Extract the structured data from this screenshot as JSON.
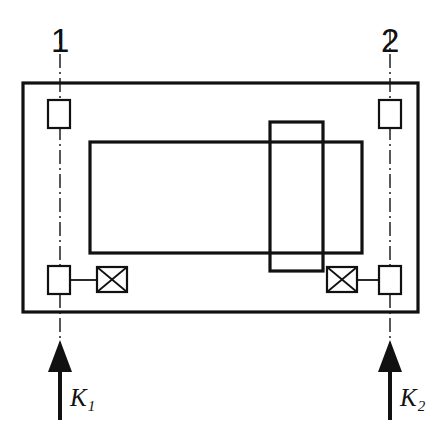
{
  "diagram": {
    "type": "engineering-line-drawing",
    "background_color": "#ffffff",
    "line_color": "#111111",
    "station_labels": [
      {
        "id": "station-1",
        "text": "1",
        "x": 60,
        "y": 24
      },
      {
        "id": "station-2",
        "text": "2",
        "x": 390,
        "y": 24
      }
    ],
    "force_labels": [
      {
        "id": "force-k1",
        "base": "K",
        "subscript": "1",
        "x": 70,
        "y": 385
      },
      {
        "id": "force-k2",
        "base": "K",
        "subscript": "2",
        "x": 400,
        "y": 385
      }
    ],
    "centerlines": [
      {
        "id": "centerline-1",
        "x": 60,
        "y_top": 30,
        "y_bottom": 348
      },
      {
        "id": "centerline-2",
        "x": 390,
        "y_top": 30,
        "y_bottom": 348
      }
    ],
    "arrows": [
      {
        "id": "arrow-k1",
        "x": 60,
        "tip_y": 340,
        "tail_y": 420,
        "head_width": 24,
        "head_height": 30
      },
      {
        "id": "arrow-k2",
        "x": 390,
        "tip_y": 340,
        "tail_y": 420,
        "head_width": 24,
        "head_height": 30
      }
    ],
    "shapes": {
      "outer_frame": {
        "id": "outer-frame",
        "x": 23,
        "y": 83,
        "width": 395,
        "height": 229,
        "stroke_width": 3.2
      },
      "main_body": {
        "id": "main-body",
        "x": 90,
        "y": 142,
        "width": 272,
        "height": 111,
        "stroke_width": 3.2
      },
      "vertical_block": {
        "id": "vertical-block",
        "x": 270,
        "y": 122,
        "width": 53,
        "height": 149,
        "stroke_width": 3.2
      },
      "pads": [
        {
          "id": "pad-top-left",
          "x": 48,
          "y": 100,
          "width": 22,
          "height": 28,
          "stroke_width": 2.2
        },
        {
          "id": "pad-top-right",
          "x": 379,
          "y": 100,
          "width": 22,
          "height": 28,
          "stroke_width": 2.2
        },
        {
          "id": "pad-bottom-left",
          "x": 48,
          "y": 266,
          "width": 22,
          "height": 28,
          "stroke_width": 2.2
        },
        {
          "id": "pad-bottom-right",
          "x": 379,
          "y": 266,
          "width": 22,
          "height": 28,
          "stroke_width": 2.2
        }
      ],
      "crossed_boxes": [
        {
          "id": "crossed-box-left",
          "x": 97,
          "y": 267,
          "width": 30,
          "height": 25,
          "stroke_width": 2.2
        },
        {
          "id": "crossed-box-right",
          "x": 327,
          "y": 267,
          "width": 30,
          "height": 25,
          "stroke_width": 2.2
        }
      ],
      "connectors": [
        {
          "id": "connector-left",
          "x1": 70,
          "y1": 280,
          "x2": 97,
          "y2": 280,
          "stroke_width": 1.8
        },
        {
          "id": "connector-right",
          "x1": 357,
          "y1": 280,
          "x2": 379,
          "y2": 280,
          "stroke_width": 1.8
        }
      ]
    }
  }
}
